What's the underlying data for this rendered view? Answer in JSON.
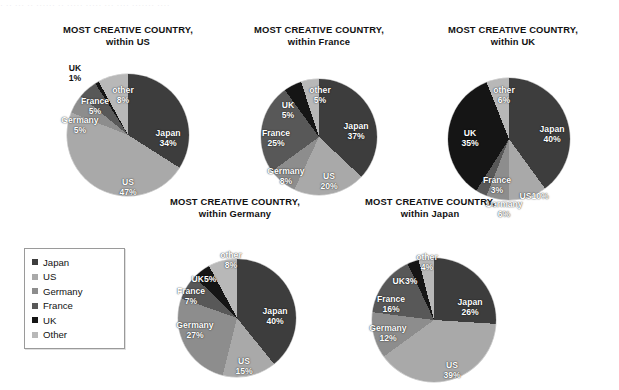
{
  "top_strip_text": "· ·· ··· ·· ······ ·· ····· ····· ··· ···· ······· ····",
  "palette": {
    "japan": "#3d3d3d",
    "us": "#a9a9a9",
    "germany": "#8d8d8d",
    "france": "#585858",
    "uk": "#151515",
    "other": "#b8b8b8",
    "background": "#ffffff",
    "text": "#111111",
    "label_text": "#ffffff"
  },
  "legend": {
    "items": [
      {
        "label": "Japan",
        "color": "#3d3d3d"
      },
      {
        "label": "US",
        "color": "#a9a9a9"
      },
      {
        "label": "Germany",
        "color": "#8d8d8d"
      },
      {
        "label": "France",
        "color": "#585858"
      },
      {
        "label": "UK",
        "color": "#151515"
      },
      {
        "label": "Other",
        "color": "#b8b8b8"
      }
    ]
  },
  "chart_data": [
    {
      "type": "pie",
      "title": "MOST CREATIVE COUNTRY,",
      "subtitle": "within US",
      "categories": [
        "Japan",
        "US",
        "Germany",
        "France",
        "UK",
        "other"
      ],
      "values": [
        34,
        47,
        5,
        5,
        1,
        8
      ],
      "labels": [
        "Japan",
        "US",
        "Germany",
        "France",
        "UK",
        "other"
      ],
      "value_labels": [
        "34%",
        "47%",
        "5%",
        "5%",
        "1%",
        "8%"
      ],
      "colors": [
        "#3d3d3d",
        "#a9a9a9",
        "#8d8d8d",
        "#585858",
        "#151515",
        "#b8b8b8"
      ],
      "legend": "shared"
    },
    {
      "type": "pie",
      "title": "MOST CREATIVE COUNTRY,",
      "subtitle": "within France",
      "categories": [
        "Japan",
        "US",
        "Germany",
        "France",
        "UK",
        "other"
      ],
      "values": [
        37,
        20,
        8,
        25,
        5,
        5
      ],
      "labels": [
        "Japan",
        "US",
        "Germany",
        "France",
        "UK",
        "other"
      ],
      "value_labels": [
        "37%",
        "20%",
        "8%",
        "25%",
        "5%",
        "5%"
      ],
      "colors": [
        "#3d3d3d",
        "#a9a9a9",
        "#8d8d8d",
        "#585858",
        "#151515",
        "#b8b8b8"
      ],
      "legend": "shared"
    },
    {
      "type": "pie",
      "title": "MOST CREATIVE COUNTRY,",
      "subtitle": "within UK",
      "categories": [
        "Japan",
        "US",
        "Germany",
        "France",
        "UK",
        "other"
      ],
      "values": [
        40,
        10,
        6,
        3,
        35,
        6
      ],
      "labels": [
        "Japan",
        "US",
        "Germany",
        "France",
        "UK",
        "other"
      ],
      "value_labels": [
        "40%",
        "US10%",
        "6%",
        "3%",
        "35%",
        "6%"
      ],
      "colors": [
        "#3d3d3d",
        "#a9a9a9",
        "#8d8d8d",
        "#585858",
        "#151515",
        "#b8b8b8"
      ],
      "legend": "shared"
    },
    {
      "type": "pie",
      "title": "MOST CREATIVE COUNTRY,",
      "subtitle": "within Germany",
      "categories": [
        "Japan",
        "US",
        "Germany",
        "France",
        "UK",
        "other"
      ],
      "values": [
        40,
        15,
        27,
        7,
        5,
        8
      ],
      "labels": [
        "Japan",
        "US",
        "Germany",
        "France",
        "UK",
        "other"
      ],
      "value_labels": [
        "40%",
        "15%",
        "27%",
        "7%",
        "5%",
        "8%"
      ],
      "colors": [
        "#3d3d3d",
        "#a9a9a9",
        "#8d8d8d",
        "#585858",
        "#151515",
        "#b8b8b8"
      ],
      "legend": "shared"
    },
    {
      "type": "pie",
      "title": "MOST CREATIVE COUNTRY,",
      "subtitle": "within Japan",
      "categories": [
        "Japan",
        "US",
        "Germany",
        "France",
        "UK",
        "other"
      ],
      "values": [
        26,
        39,
        12,
        16,
        3,
        4
      ],
      "labels": [
        "Japan",
        "US",
        "Germany",
        "France",
        "UK",
        "other"
      ],
      "value_labels": [
        "26%",
        "39%",
        "12%",
        "16%",
        "3%",
        "4%"
      ],
      "colors": [
        "#3d3d3d",
        "#a9a9a9",
        "#8d8d8d",
        "#585858",
        "#151515",
        "#b8b8b8"
      ],
      "legend": "shared"
    }
  ],
  "charts": [
    {
      "id": "chart-within-us",
      "x": 28,
      "y": 24,
      "w": 200,
      "pie_cx": 100,
      "pie_cy": 88,
      "pie_r": 61,
      "label_positions": [
        {
          "k": "japan",
          "x": 140,
          "y": 92,
          "cls": ""
        },
        {
          "k": "us",
          "x": 100,
          "y": 141,
          "cls": ""
        },
        {
          "k": "germany",
          "x": 52,
          "y": 79,
          "cls": ""
        },
        {
          "k": "france",
          "x": 67,
          "y": 60,
          "cls": ""
        },
        {
          "k": "uk",
          "x": 47,
          "y": 27,
          "cls": "dark"
        },
        {
          "k": "other",
          "x": 95,
          "y": 49,
          "cls": ""
        }
      ]
    },
    {
      "id": "chart-within-france",
      "x": 224,
      "y": 24,
      "w": 190,
      "pie_cx": 95,
      "pie_cy": 90,
      "pie_r": 58,
      "label_positions": [
        {
          "k": "japan",
          "x": 132,
          "y": 85,
          "cls": ""
        },
        {
          "k": "us",
          "x": 105,
          "y": 135,
          "cls": ""
        },
        {
          "k": "germany",
          "x": 62,
          "y": 130,
          "cls": ""
        },
        {
          "k": "france",
          "x": 52,
          "y": 92,
          "cls": ""
        },
        {
          "k": "uk",
          "x": 64,
          "y": 64,
          "cls": ""
        },
        {
          "k": "other",
          "x": 96,
          "y": 49,
          "cls": ""
        }
      ]
    },
    {
      "id": "chart-within-uk",
      "x": 413,
      "y": 24,
      "w": 200,
      "pie_cx": 96,
      "pie_cy": 92,
      "pie_r": 61,
      "label_positions": [
        {
          "k": "japan",
          "x": 139,
          "y": 88,
          "cls": ""
        },
        {
          "k": "us",
          "x": 121,
          "y": 150,
          "cls": "inline"
        },
        {
          "k": "germany",
          "x": 91,
          "y": 163,
          "cls": ""
        },
        {
          "k": "france",
          "x": 84,
          "y": 139,
          "cls": ""
        },
        {
          "k": "uk",
          "x": 57,
          "y": 92,
          "cls": ""
        },
        {
          "k": "other",
          "x": 91,
          "y": 49,
          "cls": ""
        }
      ]
    },
    {
      "id": "chart-within-germany",
      "x": 140,
      "y": 196,
      "w": 190,
      "pie_cx": 97,
      "pie_cy": 99,
      "pie_r": 59,
      "label_positions": [
        {
          "k": "japan",
          "x": 135,
          "y": 98,
          "cls": ""
        },
        {
          "k": "us",
          "x": 104,
          "y": 148,
          "cls": ""
        },
        {
          "k": "germany",
          "x": 55,
          "y": 112,
          "cls": ""
        },
        {
          "k": "france",
          "x": 51,
          "y": 78,
          "cls": ""
        },
        {
          "k": "uk",
          "x": 64,
          "y": 61,
          "cls": "inline"
        },
        {
          "k": "other",
          "x": 91,
          "y": 42,
          "cls": ""
        }
      ]
    },
    {
      "id": "chart-within-japan",
      "x": 330,
      "y": 196,
      "w": 200,
      "pie_cx": 104,
      "pie_cy": 101,
      "pie_r": 62,
      "label_positions": [
        {
          "k": "japan",
          "x": 140,
          "y": 89,
          "cls": ""
        },
        {
          "k": "us",
          "x": 122,
          "y": 152,
          "cls": ""
        },
        {
          "k": "germany",
          "x": 58,
          "y": 115,
          "cls": ""
        },
        {
          "k": "france",
          "x": 61,
          "y": 86,
          "cls": ""
        },
        {
          "k": "uk",
          "x": 75,
          "y": 63,
          "cls": "inline"
        },
        {
          "k": "other",
          "x": 97,
          "y": 44,
          "cls": ""
        }
      ]
    }
  ],
  "legend_box": {
    "x": 24,
    "y": 248,
    "w": 82
  }
}
